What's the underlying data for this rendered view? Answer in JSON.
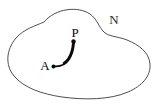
{
  "figure": {
    "type": "geometric-diagram",
    "background_color": "#ffffff",
    "width": 159,
    "height": 104,
    "region": {
      "name": "N",
      "label": "N",
      "label_x": 114,
      "label_y": 24,
      "label_font_size": 13,
      "stroke_color": "#3a3a3a",
      "stroke_width": 0.9,
      "description": "closed irregular blob outline with a concave notch on the upper right"
    },
    "curve": {
      "name": "path-A-to-P",
      "stroke_color": "#0a0a0a",
      "stroke_width_start": 1.6,
      "stroke_width_end": 3.2,
      "description": "thick curve from point A rising to point P, tapering thicker toward P"
    },
    "points": [
      {
        "id": "A",
        "label": "A",
        "dot_x": 53.5,
        "dot_y": 66.5,
        "dot_radius": 2.0,
        "label_x": 45,
        "label_y": 70,
        "label_font_size": 13,
        "color": "#0a0a0a"
      },
      {
        "id": "P",
        "label": "P",
        "dot_x": 73.5,
        "dot_y": 41.5,
        "dot_radius": 2.2,
        "label_x": 75,
        "label_y": 37,
        "label_font_size": 13,
        "color": "#0a0a0a"
      }
    ]
  }
}
